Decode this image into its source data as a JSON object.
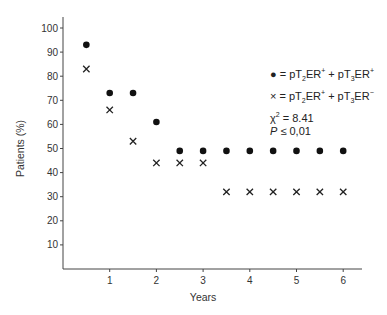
{
  "chart_data": {
    "type": "scatter",
    "title": "",
    "xlabel": "Years",
    "ylabel": "Patients (%)",
    "xlim": [
      0,
      6.4
    ],
    "ylim": [
      0,
      105
    ],
    "x_ticks": [
      "1",
      "2",
      "3",
      "4",
      "5",
      "6"
    ],
    "y_ticks": [
      "10",
      "20",
      "30",
      "40",
      "50",
      "60",
      "70",
      "80",
      "90",
      "100"
    ],
    "grid": false,
    "series": [
      {
        "name": "pT2ER+ + pT3ER+",
        "marker": "dot",
        "x": [
          0.5,
          1,
          1.5,
          2,
          2.5,
          3,
          3.5,
          4,
          4.5,
          5,
          5.5,
          6
        ],
        "values": [
          93,
          73,
          73,
          61,
          49,
          49,
          49,
          49,
          49,
          49,
          49,
          49
        ]
      },
      {
        "name": "pT2ER+ + pT3ER-",
        "marker": "cross",
        "x": [
          0.5,
          1,
          1.5,
          2,
          2.5,
          3,
          3.5,
          4,
          4.5,
          5,
          5.5,
          6
        ],
        "values": [
          83,
          66,
          53,
          44,
          44,
          44,
          32,
          32,
          32,
          32,
          32,
          32
        ]
      }
    ],
    "annotations": [
      "χ2 = 8.41",
      "P ≤ 0,01"
    ],
    "legend_position": "upper right"
  },
  "legend": {
    "dot_label": "= pT",
    "cross_label": "= pT",
    "chi": "χ",
    "chi_value": "= 8.41",
    "p_label": "P",
    "p_value": "≤ 0,01"
  }
}
